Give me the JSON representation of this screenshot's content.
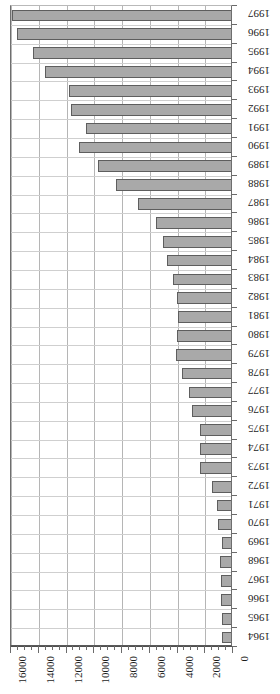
{
  "chart_data": {
    "type": "bar",
    "orientation": "horizontal",
    "title": "",
    "subtitle": "",
    "xlabel": "",
    "ylabel": "",
    "xlim": [
      0,
      16000
    ],
    "x_axis_reversed": true,
    "grid": true,
    "legend": "none",
    "bar_color": "#a9a9a9",
    "bar_border_color": "#5e5e5e",
    "x_tick_labels": [
      "16000",
      "14000",
      "12000",
      "10000",
      "8000",
      "6000",
      "4000",
      "2000",
      "0"
    ],
    "x_tick_values": [
      16000,
      14000,
      12000,
      10000,
      8000,
      6000,
      4000,
      2000,
      0
    ],
    "x_minor_tick_step": 500,
    "categories": [
      "1997",
      "1996",
      "1995",
      "1994",
      "1993",
      "1992",
      "1991",
      "1990",
      "1989",
      "1988",
      "1987",
      "1986",
      "1985",
      "1984",
      "1983",
      "1982",
      "1981",
      "1980",
      "1979",
      "1978",
      "1977",
      "1976",
      "1975",
      "1974",
      "1973",
      "1972",
      "1971",
      "1970",
      "1969",
      "1968",
      "1967",
      "1966",
      "1965",
      "1964"
    ],
    "values": [
      15900,
      15600,
      14400,
      13550,
      11800,
      11700,
      10600,
      11100,
      9700,
      8400,
      6850,
      5550,
      5050,
      4750,
      4350,
      4050,
      3950,
      4050,
      4100,
      3670,
      3170,
      2950,
      2380,
      2380,
      2380,
      1520,
      1150,
      1080,
      790,
      940,
      900,
      880,
      780,
      760
    ]
  }
}
